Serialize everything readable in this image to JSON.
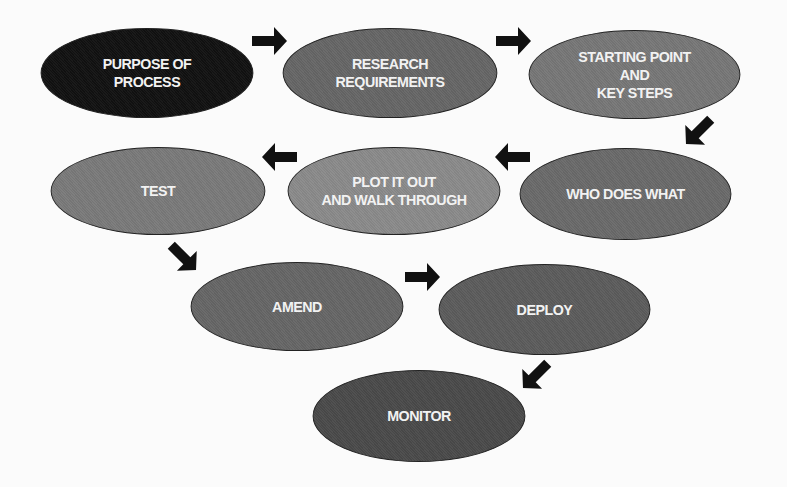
{
  "diagram": {
    "title": "",
    "nodes": [
      {
        "id": "purpose",
        "label": "PURPOSE OF\nPROCESS",
        "color": "#111111"
      },
      {
        "id": "research",
        "label": "RESEARCH\nREQUIREMENTS",
        "color": "#666666"
      },
      {
        "id": "starting",
        "label": "STARTING POINT\nAND\nKEY STEPS",
        "color": "#777777"
      },
      {
        "id": "who",
        "label": "WHO DOES WHAT",
        "color": "#6a6a6a"
      },
      {
        "id": "plot",
        "label": "PLOT IT OUT\nAND WALK THROUGH",
        "color": "#8a8a8a"
      },
      {
        "id": "test",
        "label": "TEST",
        "color": "#7a7a7a"
      },
      {
        "id": "amend",
        "label": "AMEND",
        "color": "#666666"
      },
      {
        "id": "deploy",
        "label": "DEPLOY",
        "color": "#5c5c5c"
      },
      {
        "id": "monitor",
        "label": "MONITOR",
        "color": "#4a4a4a"
      }
    ],
    "edges": [
      {
        "from": "purpose",
        "to": "research",
        "direction": "right"
      },
      {
        "from": "research",
        "to": "starting",
        "direction": "right"
      },
      {
        "from": "starting",
        "to": "who",
        "direction": "down-left"
      },
      {
        "from": "who",
        "to": "plot",
        "direction": "left"
      },
      {
        "from": "plot",
        "to": "test",
        "direction": "left"
      },
      {
        "from": "test",
        "to": "amend",
        "direction": "down-right"
      },
      {
        "from": "amend",
        "to": "deploy",
        "direction": "right"
      },
      {
        "from": "deploy",
        "to": "monitor",
        "direction": "down-left"
      }
    ],
    "arrow_color": "#111111"
  }
}
